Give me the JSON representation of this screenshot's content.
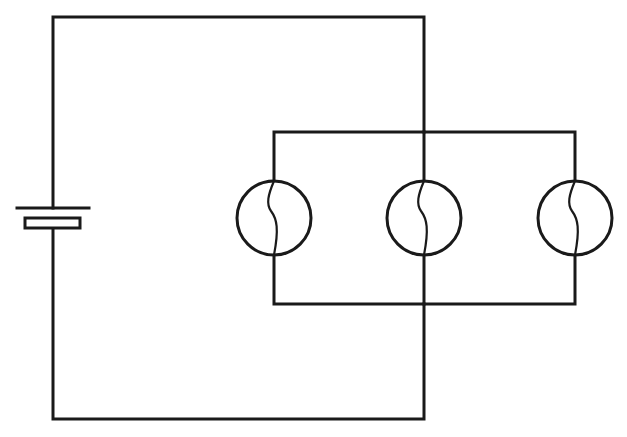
{
  "diagram": {
    "type": "circuit-schematic",
    "colors": {
      "line": "#1a1a1a",
      "background": "#ffffff"
    },
    "components": {
      "battery": {
        "name": "cell",
        "symbol": "battery",
        "x": 53,
        "y_long_plate": 208,
        "y_short_plate": 223
      },
      "bulbs": [
        {
          "name": "bulb-1",
          "symbol": "lamp",
          "cx": 274,
          "cy": 218,
          "r": 37
        },
        {
          "name": "bulb-2",
          "symbol": "lamp",
          "cx": 424,
          "cy": 218,
          "r": 37
        },
        {
          "name": "bulb-3",
          "symbol": "lamp",
          "cx": 575,
          "cy": 218,
          "r": 37
        }
      ]
    },
    "connections": {
      "outer_loop": {
        "left": 53,
        "right": 424,
        "top": 17,
        "bottom": 419
      },
      "parallel_box": {
        "left": 274,
        "right": 575,
        "top": 132,
        "bottom": 304
      }
    },
    "caption": ""
  }
}
